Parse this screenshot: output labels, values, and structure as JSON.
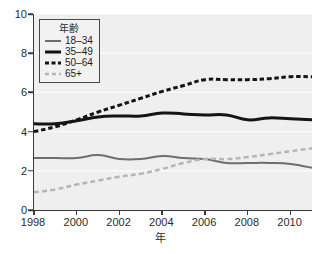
{
  "chart_data": {
    "type": "line",
    "title": "",
    "xlabel": "年",
    "ylabel": "",
    "xlim": [
      1998,
      2011
    ],
    "ylim": [
      0,
      10
    ],
    "grid": true,
    "legend_position": "top-left",
    "legend_title": "年齢",
    "x": [
      1998,
      1999,
      2000,
      2001,
      2002,
      2003,
      2004,
      2005,
      2006,
      2007,
      2008,
      2009,
      2010,
      2011
    ],
    "x_tick_labels": [
      "1998",
      "2000",
      "2002",
      "2004",
      "2006",
      "2008",
      "2010"
    ],
    "x_ticks": [
      1998,
      2000,
      2002,
      2004,
      2006,
      2008,
      2010
    ],
    "y_tick_labels": [
      "0",
      "2",
      "4",
      "6",
      "8",
      "10"
    ],
    "y_ticks": [
      0,
      2,
      4,
      6,
      8,
      10
    ],
    "series": [
      {
        "name": "18–34",
        "color": "#6e6e6e",
        "style": "solid",
        "width": 2,
        "values": [
          2.65,
          2.65,
          2.65,
          2.8,
          2.6,
          2.6,
          2.75,
          2.65,
          2.6,
          2.4,
          2.4,
          2.4,
          2.35,
          2.15
        ]
      },
      {
        "name": "35–49",
        "color": "#141414",
        "style": "solid",
        "width": 3,
        "values": [
          4.4,
          4.4,
          4.55,
          4.75,
          4.8,
          4.8,
          4.95,
          4.9,
          4.85,
          4.85,
          4.6,
          4.7,
          4.65,
          4.6
        ]
      },
      {
        "name": "50–64",
        "color": "#141414",
        "style": "dashed",
        "width": 3,
        "values": [
          4.0,
          4.25,
          4.6,
          5.0,
          5.35,
          5.7,
          6.05,
          6.35,
          6.65,
          6.65,
          6.65,
          6.7,
          6.8,
          6.8
        ]
      },
      {
        "name": "65+",
        "color": "#b6b6b6",
        "style": "dashed",
        "width": 2.5,
        "values": [
          0.9,
          1.05,
          1.3,
          1.5,
          1.7,
          1.85,
          2.1,
          2.4,
          2.6,
          2.6,
          2.7,
          2.85,
          3.0,
          3.15
        ]
      }
    ]
  },
  "colors": {
    "plot_background": "#efefef",
    "page_background": "#ffffff",
    "axis": "#3a3a3a",
    "gridline": "#fbfbfb",
    "text": "#2b2b2b"
  }
}
